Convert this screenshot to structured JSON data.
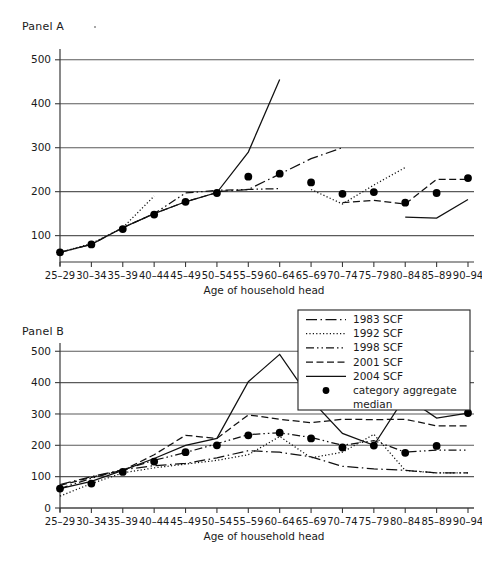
{
  "figure": {
    "panel_a": {
      "label": "Panel A"
    },
    "panel_b": {
      "label": "Panel B"
    },
    "axis": {
      "xlabel": "Age of household head",
      "categories": [
        "25–29",
        "30–34",
        "35–39",
        "40–44",
        "45–49",
        "50–54",
        "55–59",
        "60–64",
        "65–69",
        "70–74",
        "75–79",
        "80–84",
        "85–89",
        "90–94"
      ]
    },
    "legend": {
      "entries": [
        {
          "label": "1983 SCF",
          "style": "dashdot-long"
        },
        {
          "label": "1992 SCF",
          "style": "dotted"
        },
        {
          "label": "1998 SCF",
          "style": "dashdotdot"
        },
        {
          "label": "2001 SCF",
          "style": "dashed"
        },
        {
          "label": "2004 SCF",
          "style": "solid"
        },
        {
          "label": "category aggregate",
          "label2": "median",
          "style": "marker"
        }
      ]
    },
    "colors": {
      "ink": "#111111",
      "grid": "#5a5a5a",
      "axis": "#3a3a3a",
      "marker": "#000000"
    }
  },
  "chart_data": [
    {
      "id": "panel-a",
      "type": "line",
      "title": "Panel A",
      "xlabel": "Age of household head",
      "ylabel": "",
      "grid": true,
      "legend_position": "none",
      "ylim": [
        40,
        520
      ],
      "yticks": [
        100,
        200,
        300,
        400,
        500
      ],
      "categories": [
        "25–29",
        "30–34",
        "35–39",
        "40–44",
        "45–49",
        "50–54",
        "55–59",
        "60–64",
        "65–69",
        "70–74",
        "75–79",
        "80–84",
        "85–89",
        "90–94"
      ],
      "series": [
        {
          "name": "1983 SCF",
          "style": "dashdot-long",
          "values": [
            null,
            null,
            null,
            null,
            null,
            200,
            205,
            240,
            275,
            300,
            null,
            null,
            null,
            null
          ]
        },
        {
          "name": "1992 SCF",
          "style": "dotted",
          "values": [
            62,
            82,
            118,
            190,
            null,
            null,
            null,
            null,
            205,
            172,
            215,
            255,
            null,
            null
          ]
        },
        {
          "name": "1998 SCF",
          "style": "dashdotdot",
          "values": [
            62,
            80,
            118,
            150,
            197,
            203,
            205,
            207,
            null,
            null,
            null,
            null,
            null,
            null
          ]
        },
        {
          "name": "2001 SCF",
          "style": "dashed",
          "values": [
            null,
            null,
            118,
            150,
            177,
            198,
            null,
            null,
            null,
            175,
            180,
            172,
            228,
            228
          ]
        },
        {
          "name": "2004 SCF",
          "style": "solid",
          "values": [
            62,
            80,
            118,
            150,
            177,
            198,
            290,
            455,
            null,
            null,
            null,
            142,
            140,
            182
          ]
        }
      ],
      "markers": {
        "name": "category aggregate median",
        "values": [
          62,
          80,
          115,
          148,
          177,
          197,
          234,
          241,
          221,
          195,
          199,
          175,
          197,
          231
        ]
      }
    },
    {
      "id": "panel-b",
      "type": "line",
      "title": "Panel B",
      "xlabel": "Age of household head",
      "ylabel": "",
      "grid": true,
      "legend_position": "top-right",
      "ylim": [
        0,
        520
      ],
      "yticks": [
        0,
        100,
        200,
        300,
        400,
        500
      ],
      "categories": [
        "25–29",
        "30–34",
        "35–39",
        "40–44",
        "45–49",
        "50–54",
        "55–59",
        "60–64",
        "65–69",
        "70–74",
        "75–79",
        "80–84",
        "85–89",
        "90–94"
      ],
      "series": [
        {
          "name": "1983 SCF",
          "style": "dashdot-long",
          "values": [
            75,
            100,
            122,
            135,
            142,
            160,
            183,
            178,
            163,
            133,
            125,
            120,
            112,
            112
          ]
        },
        {
          "name": "1992 SCF",
          "style": "dotted",
          "values": [
            38,
            78,
            112,
            128,
            140,
            152,
            170,
            228,
            160,
            178,
            235,
            120,
            112,
            112
          ]
        },
        {
          "name": "1998 SCF",
          "style": "dashdotdot",
          "values": [
            62,
            95,
            122,
            152,
            177,
            205,
            234,
            240,
            225,
            200,
            215,
            178,
            185,
            185
          ]
        },
        {
          "name": "2001 SCF",
          "style": "dashed",
          "values": [
            72,
            98,
            120,
            170,
            232,
            222,
            297,
            283,
            272,
            283,
            282,
            283,
            262,
            262
          ]
        },
        {
          "name": "2004 SCF",
          "style": "solid",
          "values": [
            62,
            85,
            120,
            158,
            200,
            222,
            403,
            490,
            345,
            238,
            200,
            355,
            287,
            303
          ]
        }
      ],
      "markers": {
        "name": "category aggregate median",
        "values": [
          62,
          78,
          115,
          148,
          178,
          200,
          232,
          240,
          222,
          193,
          199,
          176,
          198,
          303
        ]
      }
    }
  ]
}
